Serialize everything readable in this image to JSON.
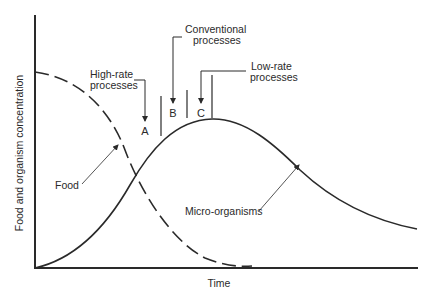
{
  "diagram": {
    "axes": {
      "ylabel": "Food and organism concentration",
      "xlabel": "Time"
    },
    "curves": {
      "food": {
        "label": "Food",
        "style": "dashed"
      },
      "micro": {
        "label": "Micro-organisms",
        "style": "solid"
      }
    },
    "zones": {
      "a": {
        "letter": "A",
        "label_line1": "High-rate",
        "label_line2": "processes"
      },
      "b": {
        "letter": "B",
        "label_line1": "Conventional",
        "label_line2": "processes"
      },
      "c": {
        "letter": "C",
        "label_line1": "Low-rate",
        "label_line2": "processes"
      }
    },
    "colors": {
      "ink": "#2a2a2a",
      "background": "#ffffff"
    }
  }
}
